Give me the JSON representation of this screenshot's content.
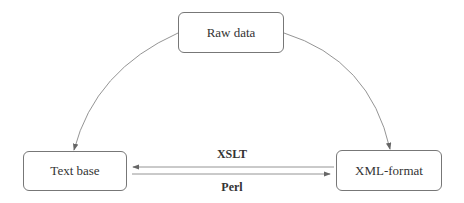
{
  "nodes": {
    "raw": "Raw data",
    "text": "Text base",
    "xml": "XML-format"
  },
  "edges": {
    "xslt": "XSLT",
    "perl": "Perl"
  },
  "colors": {
    "line": "#888888",
    "border": "#777777"
  }
}
